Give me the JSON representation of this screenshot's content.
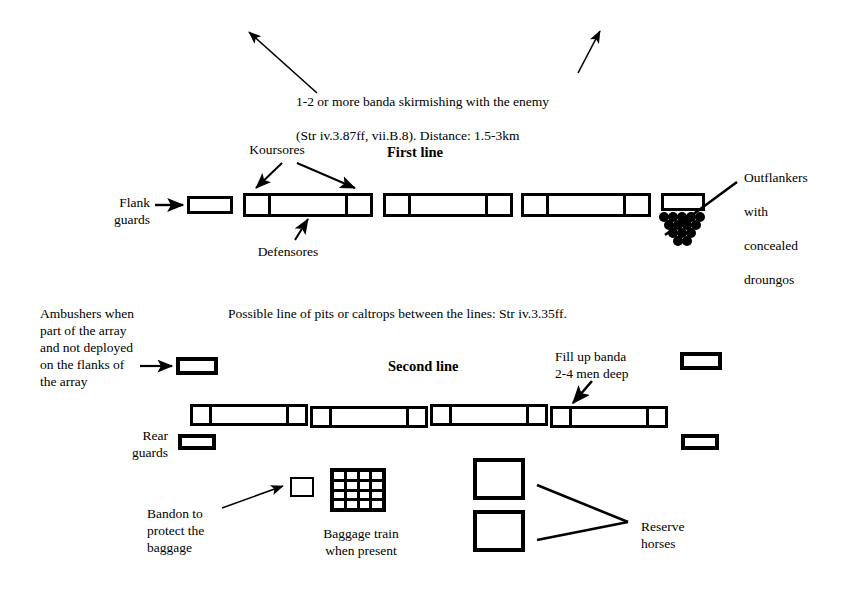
{
  "diagram": {
    "skirmish_note": "1-2 or more banda skirmishing with the enemy\n(Str iv.3.87ff, vii.B.8). Distance: 1.5-3km",
    "skirmish_note_pre": "1-2 or more ",
    "skirmish_note_ital": "banda",
    "skirmish_note_post": " skirmishing with the enemy",
    "skirmish_note_line2": "(Str iv.3.87ff, vii.B.8). Distance: 1.5-3km",
    "first_line_title": "First line",
    "second_line_title": "Second line",
    "koursores_label": "Koursores",
    "defensores_label": "Defensores",
    "flank_guards_label": "Flank\nguards",
    "outflankers_line1": "Outflankers",
    "outflankers_line2": "with",
    "outflankers_line3": "concealed",
    "outflankers_line4": "droungos",
    "pits_note": "Possible line of pits or caltrops between the lines: Str iv.3.35ff.",
    "ambushers_label": "Ambushers when\npart of the array\nand not deployed\non the flanks of\nthe array",
    "fill_up_label": "Fill up banda\n2-4 men deep",
    "rear_guards_label": "Rear\nguards",
    "bandon_label": "Bandon to\nprotect the\nbaggage",
    "baggage_label": "Baggage train\nwhen present",
    "reserve_label": "Reserve\nhorses",
    "colors": {
      "ink": "#000000",
      "paper": "#ffffff"
    },
    "counts": {
      "first_line_units": 5,
      "second_line_segments": 4,
      "outflanker_dot_rows": 4,
      "baggage_grid": "4x4",
      "reserve_horse_boxes": 2
    }
  }
}
